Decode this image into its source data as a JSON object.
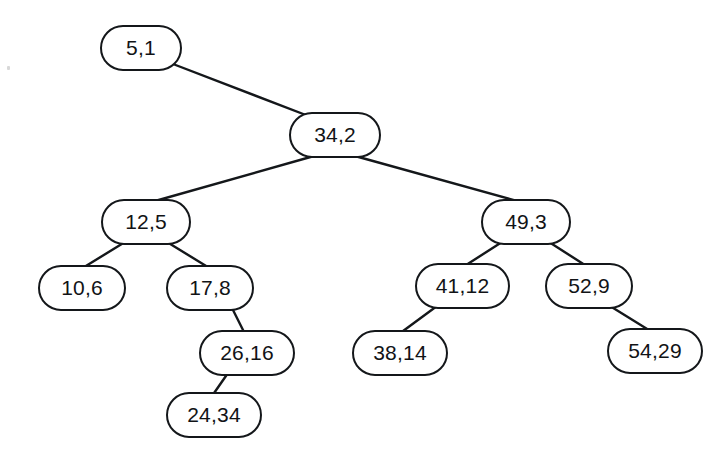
{
  "figure": {
    "kind": "binary-search-tree-diagram",
    "background_color": "#ffffff",
    "stroke_color": "#14171a",
    "text_color": "#111316",
    "node_shape": "rounded-stadium",
    "canvas": {
      "width": 725,
      "height": 462
    }
  },
  "nodes": [
    {
      "id": "n5",
      "label": "5,1",
      "key": 5,
      "value": 1,
      "x": 100,
      "y": 25,
      "w": 82,
      "h": 46,
      "font_size": 21,
      "level": 0
    },
    {
      "id": "n34",
      "label": "34,2",
      "key": 34,
      "value": 2,
      "x": 289,
      "y": 112,
      "w": 92,
      "h": 46,
      "font_size": 21,
      "level": 1
    },
    {
      "id": "n12",
      "label": "12,5",
      "key": 12,
      "value": 5,
      "x": 101,
      "y": 199,
      "w": 90,
      "h": 46,
      "font_size": 21,
      "level": 2
    },
    {
      "id": "n49",
      "label": "49,3",
      "key": 49,
      "value": 3,
      "x": 481,
      "y": 199,
      "w": 90,
      "h": 46,
      "font_size": 21,
      "level": 2
    },
    {
      "id": "n10",
      "label": "10,6",
      "key": 10,
      "value": 6,
      "x": 38,
      "y": 265,
      "w": 88,
      "h": 46,
      "font_size": 21,
      "level": 3
    },
    {
      "id": "n17",
      "label": "17,8",
      "key": 17,
      "value": 8,
      "x": 166,
      "y": 265,
      "w": 88,
      "h": 46,
      "font_size": 21,
      "level": 3
    },
    {
      "id": "n41",
      "label": "41,12",
      "key": 41,
      "value": 12,
      "x": 415,
      "y": 263,
      "w": 95,
      "h": 46,
      "font_size": 21,
      "level": 3
    },
    {
      "id": "n52",
      "label": "52,9",
      "key": 52,
      "value": 9,
      "x": 545,
      "y": 263,
      "w": 88,
      "h": 46,
      "font_size": 21,
      "level": 3
    },
    {
      "id": "n26",
      "label": "26,16",
      "key": 26,
      "value": 16,
      "x": 199,
      "y": 330,
      "w": 96,
      "h": 46,
      "font_size": 21,
      "level": 4
    },
    {
      "id": "n38",
      "label": "38,14",
      "key": 38,
      "value": 14,
      "x": 352,
      "y": 330,
      "w": 96,
      "h": 46,
      "font_size": 21,
      "level": 4
    },
    {
      "id": "n54",
      "label": "54,29",
      "key": 54,
      "value": 29,
      "x": 607,
      "y": 328,
      "w": 96,
      "h": 46,
      "font_size": 21,
      "level": 4
    },
    {
      "id": "n24",
      "label": "24,34",
      "key": 24,
      "value": 34,
      "x": 166,
      "y": 392,
      "w": 96,
      "h": 46,
      "font_size": 21,
      "level": 5
    }
  ],
  "edges": [
    {
      "from": "n5",
      "to": "n34",
      "side": "right",
      "x1": 173,
      "y1": 64,
      "x2": 311,
      "y2": 117
    },
    {
      "from": "n34",
      "to": "n12",
      "side": "left",
      "x1": 314,
      "y1": 156,
      "x2": 148,
      "y2": 203
    },
    {
      "from": "n34",
      "to": "n49",
      "side": "right",
      "x1": 355,
      "y1": 156,
      "x2": 524,
      "y2": 203
    },
    {
      "from": "n12",
      "to": "n10",
      "side": "left",
      "x1": 125,
      "y1": 242,
      "x2": 81,
      "y2": 269
    },
    {
      "from": "n12",
      "to": "n17",
      "side": "right",
      "x1": 167,
      "y1": 242,
      "x2": 211,
      "y2": 269
    },
    {
      "from": "n17",
      "to": "n26",
      "side": "right",
      "x1": 232,
      "y1": 308,
      "x2": 245,
      "y2": 334
    },
    {
      "from": "n26",
      "to": "n24",
      "side": "left",
      "x1": 228,
      "y1": 373,
      "x2": 212,
      "y2": 396
    },
    {
      "from": "n49",
      "to": "n41",
      "side": "left",
      "x1": 502,
      "y1": 242,
      "x2": 463,
      "y2": 267
    },
    {
      "from": "n49",
      "to": "n52",
      "side": "right",
      "x1": 549,
      "y1": 242,
      "x2": 588,
      "y2": 267
    },
    {
      "from": "n41",
      "to": "n38",
      "side": "left",
      "x1": 437,
      "y1": 306,
      "x2": 399,
      "y2": 334
    },
    {
      "from": "n52",
      "to": "n54",
      "side": "right",
      "x1": 610,
      "y1": 306,
      "x2": 652,
      "y2": 332
    }
  ]
}
